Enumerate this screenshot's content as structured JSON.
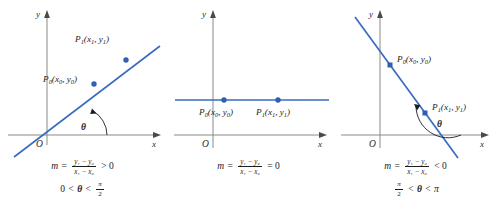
{
  "figure": {
    "type": "diagram",
    "colors": {
      "line": "#3a6bbf",
      "point": "#2f5fb0",
      "axis": "#8a8a8a",
      "text": "#1c1c1c"
    },
    "axis_labels": {
      "x": "x",
      "y": "y",
      "origin": "O"
    }
  },
  "panels": [
    {
      "id": "positive-slope",
      "slope_sign": "positive",
      "line": {
        "from": [
          -40,
          -28
        ],
        "to": [
          125,
          52
        ],
        "marker": "round"
      },
      "points": [
        {
          "name": "P0",
          "label_P": "P",
          "label_sub": "0",
          "label_coords": "(x",
          "full": "P0(x0, y0)"
        },
        {
          "name": "P1",
          "label_P": "P",
          "label_sub": "1",
          "label_coords": "(x",
          "full": "P1(x1, y1)"
        }
      ],
      "point_labels": {
        "p0": "P₀(x₀, y₀)",
        "p1": "P₁(x₁, y₁)"
      },
      "angle": {
        "symbol": "θ",
        "position": "between x-axis and line, opening counterclockwise"
      },
      "equation": {
        "m": "m",
        "equals": "=",
        "numerator": "y₁ − y₀",
        "denominator": "x₁ − x₀",
        "relation": "> 0"
      },
      "angle_condition": {
        "left": "0",
        "rel1": "<",
        "theta": "θ",
        "rel2": "<",
        "right_num": "π",
        "right_den": "2"
      }
    },
    {
      "id": "zero-slope",
      "slope_sign": "zero",
      "line": {
        "from": [
          -40,
          18
        ],
        "to": [
          128,
          18
        ],
        "marker": "round"
      },
      "point_labels": {
        "p0": "P₀(x₀, y₀)",
        "p1": "P₁(x₁, y₁)"
      },
      "angle": null,
      "equation": {
        "m": "m",
        "equals": "=",
        "numerator": "y₁ − y₀",
        "denominator": "x₁ − x₀",
        "relation": "= 0"
      },
      "angle_condition": null
    },
    {
      "id": "negative-slope",
      "slope_sign": "negative",
      "line": {
        "from": [
          -42,
          72
        ],
        "to": [
          86,
          -42
        ],
        "marker": "square"
      },
      "point_labels": {
        "p0": "P₀(x₀, y₀)",
        "p1": "P₁(x₁, y₁)"
      },
      "angle": {
        "symbol": "θ",
        "position": "between positive x-axis and line, obtuse"
      },
      "equation": {
        "m": "m",
        "equals": "=",
        "numerator": "y₁ − y₀",
        "denominator": "x₁ − x₀",
        "relation": "< 0"
      },
      "angle_condition": {
        "left_num": "π",
        "left_den": "2",
        "rel1": "<",
        "theta": "θ",
        "rel2": "<",
        "right": "π"
      }
    }
  ]
}
